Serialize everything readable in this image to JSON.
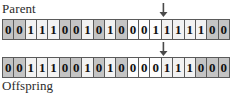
{
  "diagram": {
    "title_visible": false,
    "rows": [
      {
        "label": "Parent",
        "label_position": "above",
        "bits": [
          "0",
          "0",
          "1",
          "1",
          "1",
          "0",
          "0",
          "1",
          "0",
          "1",
          "0",
          "0",
          "0",
          "1",
          "1",
          "1",
          "1",
          "1",
          "0",
          "0"
        ],
        "shades": [
          "dark",
          "dark",
          "light",
          "light",
          "light",
          "dark",
          "dark",
          "light",
          "dark",
          "light",
          "dark",
          "white",
          "white",
          "white",
          "light",
          "light",
          "light",
          "light",
          "dark",
          "dark"
        ]
      },
      {
        "label": "Offspring",
        "label_position": "below",
        "bits": [
          "0",
          "0",
          "1",
          "1",
          "1",
          "0",
          "0",
          "1",
          "0",
          "1",
          "0",
          "0",
          "0",
          "0",
          "1",
          "1",
          "1",
          "0",
          "0",
          "0"
        ],
        "shades": [
          "dark",
          "dark",
          "light",
          "light",
          "light",
          "dark",
          "dark",
          "light",
          "dark",
          "light",
          "dark",
          "white",
          "white",
          "white",
          "light",
          "light",
          "light",
          "dark",
          "dark",
          "dark"
        ]
      }
    ],
    "arrows": [
      {
        "name": "mutation-point-arrow-parent",
        "glyph": "down-arrow",
        "target_bit_index": 15
      },
      {
        "name": "mutation-point-arrow-offspring",
        "glyph": "down-arrow",
        "target_bit_index": 15
      }
    ],
    "colors": {
      "border": "#5a5a5a",
      "cell_dark": "#c4c4c4",
      "cell_light": "#f2f2f2",
      "cell_white": "#fdfdfd",
      "text": "#111111",
      "background": "#ffffff"
    }
  }
}
